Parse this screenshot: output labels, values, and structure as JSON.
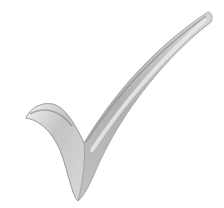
{
  "image": {
    "subject": "checkmark",
    "style": "grayscale 3D shaded tick",
    "label": "Checkmark",
    "colors": {
      "background": "#ffffff",
      "light": "#e6e6e6",
      "mid": "#bdbdbd",
      "dark": "#8c8c8c",
      "edge": "#a8a8a8"
    }
  }
}
